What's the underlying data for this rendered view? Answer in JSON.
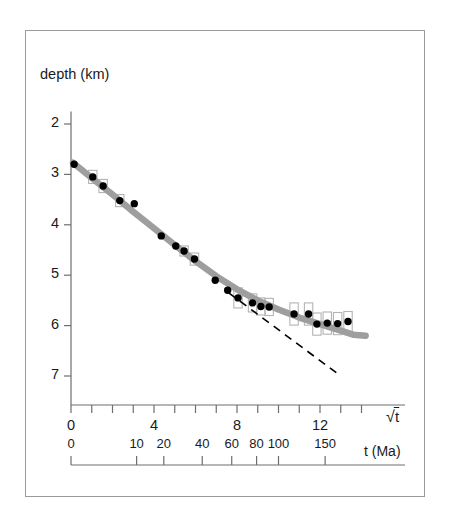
{
  "figure": {
    "background_color": "#ffffff",
    "frame_color": "#9a9a9a",
    "curve_color": "#9e9e9e",
    "marker_color": "#000000",
    "errorbar_color": "#b4b4b4",
    "dashed_color": "#000000",
    "axis_color": "#6e6e6e"
  },
  "chart_data": {
    "type": "scatter",
    "title": "",
    "ylabel": "depth (km)",
    "xlabel": "√t",
    "xlabel2": "t (Ma)",
    "grid": false,
    "legend": "none",
    "xlim": [
      -0.4,
      14.4
    ],
    "ylim": [
      7.2,
      1.7
    ],
    "y_ticks": [
      2,
      3,
      4,
      5,
      6,
      7
    ],
    "y_tick_labels": [
      "2",
      "3",
      "4",
      "5",
      "6",
      "7"
    ],
    "x_ticks": [
      0,
      1,
      2,
      3,
      4,
      5,
      6,
      7,
      8,
      9,
      10,
      11,
      12,
      13,
      14
    ],
    "x_tick_labels_shown": {
      "0": "0",
      "4": "4",
      "8": "8",
      "12": "12"
    },
    "x_axis2_ticks_ma": [
      0,
      10,
      20,
      40,
      60,
      80,
      100,
      150
    ],
    "x_axis2_tick_labels": [
      "0",
      "10",
      "20",
      "40",
      "60",
      "80",
      "100",
      "150"
    ],
    "series": [
      {
        "name": "observed mean depth",
        "type": "scatter",
        "marker": "filled-circle",
        "points": [
          {
            "x": 0.15,
            "y": 2.8,
            "err": 0.0
          },
          {
            "x": 1.05,
            "y": 3.05,
            "err": 0.13
          },
          {
            "x": 1.55,
            "y": 3.23,
            "err": 0.13
          },
          {
            "x": 2.35,
            "y": 3.52,
            "err": 0.12
          },
          {
            "x": 3.05,
            "y": 3.58,
            "err": 0.0
          },
          {
            "x": 4.35,
            "y": 4.22,
            "err": 0.0
          },
          {
            "x": 5.05,
            "y": 4.42,
            "err": 0.0
          },
          {
            "x": 5.45,
            "y": 4.52,
            "err": 0.1
          },
          {
            "x": 5.95,
            "y": 4.68,
            "err": 0.12
          },
          {
            "x": 6.95,
            "y": 5.1,
            "err": 0.0
          },
          {
            "x": 7.55,
            "y": 5.3,
            "err": 0.0
          },
          {
            "x": 8.05,
            "y": 5.45,
            "err": 0.2
          },
          {
            "x": 8.75,
            "y": 5.55,
            "err": 0.18
          },
          {
            "x": 9.15,
            "y": 5.62,
            "err": 0.17
          },
          {
            "x": 9.55,
            "y": 5.63,
            "err": 0.17
          },
          {
            "x": 10.75,
            "y": 5.77,
            "err": 0.22
          },
          {
            "x": 11.45,
            "y": 5.77,
            "err": 0.22
          },
          {
            "x": 11.85,
            "y": 5.97,
            "err": 0.22
          },
          {
            "x": 12.35,
            "y": 5.95,
            "err": 0.22
          },
          {
            "x": 12.85,
            "y": 5.96,
            "err": 0.22
          },
          {
            "x": 13.35,
            "y": 5.92,
            "err": 0.2
          }
        ]
      },
      {
        "name": "plate model fit",
        "type": "line",
        "style": "solid-thick-gray",
        "points": [
          {
            "x": 0.1,
            "y": 2.77
          },
          {
            "x": 1.0,
            "y": 3.07
          },
          {
            "x": 2.0,
            "y": 3.4
          },
          {
            "x": 3.0,
            "y": 3.74
          },
          {
            "x": 4.0,
            "y": 4.07
          },
          {
            "x": 5.0,
            "y": 4.4
          },
          {
            "x": 6.0,
            "y": 4.72
          },
          {
            "x": 7.0,
            "y": 5.02
          },
          {
            "x": 8.0,
            "y": 5.28
          },
          {
            "x": 9.0,
            "y": 5.5
          },
          {
            "x": 10.0,
            "y": 5.68
          },
          {
            "x": 11.0,
            "y": 5.84
          },
          {
            "x": 12.0,
            "y": 5.97
          },
          {
            "x": 13.0,
            "y": 6.1
          },
          {
            "x": 13.6,
            "y": 6.18
          },
          {
            "x": 14.2,
            "y": 6.2
          }
        ]
      },
      {
        "name": "half-space cooling extrapolation",
        "type": "line",
        "style": "dashed",
        "points": [
          {
            "x": 7.6,
            "y": 5.35
          },
          {
            "x": 13.0,
            "y": 7.0
          }
        ]
      }
    ]
  },
  "axis2": {
    "label": "t (Ma)",
    "ticks": [
      {
        "value": 0,
        "label": "0",
        "sqrt": 0.0
      },
      {
        "value": 10,
        "label": "10",
        "sqrt": 3.162
      },
      {
        "value": 20,
        "label": "20",
        "sqrt": 4.472
      },
      {
        "value": 40,
        "label": "40",
        "sqrt": 6.325
      },
      {
        "value": 60,
        "label": "60",
        "sqrt": 7.746
      },
      {
        "value": 80,
        "label": "80",
        "sqrt": 8.944
      },
      {
        "value": 100,
        "label": "100",
        "sqrt": 10.0
      },
      {
        "value": 150,
        "label": "150",
        "sqrt": 12.247
      }
    ]
  }
}
